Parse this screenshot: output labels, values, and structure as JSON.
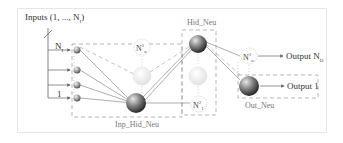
{
  "diagram": {
    "inputs_label": "Inputs (1, ..., N",
    "inputs_label_sub": "I",
    "inputs_label_close": ")",
    "input_top_label": "N",
    "input_top_sub": "I",
    "input_bottom_label": "1",
    "layers": {
      "inp_hid": {
        "label": "Inp_Hid_Neu"
      },
      "hid": {
        "label": "Hid_Neu"
      },
      "out": {
        "label": "Out_Neu"
      }
    },
    "nodes": {
      "n_a": {
        "label": "N",
        "sup": "1",
        "sub": "a"
      },
      "n_1": {
        "label": "N",
        "sup": "2",
        "sub": "1"
      },
      "n_2a": {
        "label": "N",
        "sup": "2",
        "sub": "a"
      },
      "n_out": {
        "label": "N",
        "sup": "1",
        "sub": "o"
      },
      "n_out1": {
        "label": "N",
        "sup": "",
        "sub": ""
      }
    },
    "outputs": {
      "top": "Output N",
      "top_sub": "O",
      "bottom": "Output 1"
    },
    "colors": {
      "line": "#777777",
      "dash": "#888888",
      "frame": "#e6e6e6",
      "sphere_dark": "#3a3a3a",
      "sphere_light": "#d8d8d8"
    }
  }
}
